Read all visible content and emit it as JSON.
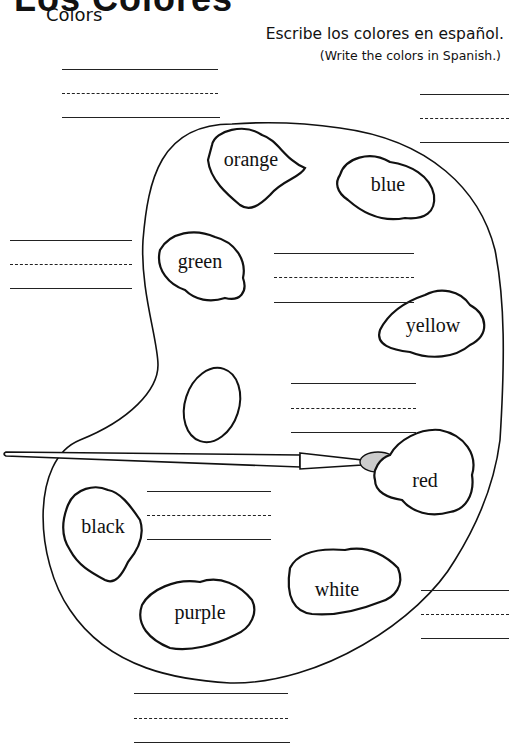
{
  "header": {
    "title": "Los Colores",
    "subtitle": "Colors",
    "instruction_es": "Escribe los colores en español.",
    "instruction_en": "(Write the colors in Spanish.)"
  },
  "paint_blobs": [
    {
      "label": "orange"
    },
    {
      "label": "blue"
    },
    {
      "label": "green"
    },
    {
      "label": "yellow"
    },
    {
      "label": "red"
    },
    {
      "label": "black"
    },
    {
      "label": "purple"
    },
    {
      "label": "white"
    }
  ],
  "answer_line_sets": [
    {
      "id": "top-left"
    },
    {
      "id": "top-right"
    },
    {
      "id": "left-green"
    },
    {
      "id": "center-yellow"
    },
    {
      "id": "center-red"
    },
    {
      "id": "center-black"
    },
    {
      "id": "right-white"
    },
    {
      "id": "bottom-purple"
    }
  ],
  "colors": {
    "ink": "#111111",
    "paper": "#ffffff"
  }
}
